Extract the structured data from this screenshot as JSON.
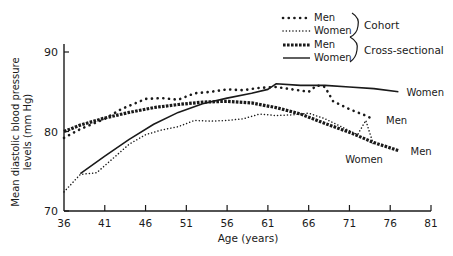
{
  "chart_data": {
    "type": "line",
    "title": "",
    "xlabel": "Age (years)",
    "ylabel": "Mean diastolic blood pressure levels (mm Hg)",
    "xlim": [
      36,
      81
    ],
    "ylim": [
      70,
      90
    ],
    "x_ticks": [
      "36",
      "41",
      "46",
      "51",
      "56",
      "61",
      "66",
      "71",
      "76",
      "81"
    ],
    "y_ticks": [
      "70",
      "80",
      "90"
    ],
    "grid": false,
    "legend": {
      "position": "top-right",
      "entries": [
        {
          "label": "Men",
          "style": "dotted-large",
          "group": "Cohort"
        },
        {
          "label": "Women",
          "style": "dotted-small",
          "group": "Cohort"
        },
        {
          "label": "Men",
          "style": "dashed-heavy",
          "group": "Cross-sectional"
        },
        {
          "label": "Women",
          "style": "solid",
          "group": "Cross-sectional"
        }
      ],
      "groups": [
        "Cohort",
        "Cross-sectional"
      ]
    },
    "series": [
      {
        "name": "Cohort Men",
        "style": "dotted-large",
        "x": [
          36,
          38,
          41,
          43,
          46,
          48,
          50,
          52,
          54,
          56,
          58,
          60,
          62,
          64,
          66,
          67,
          68,
          69,
          71,
          73,
          74
        ],
        "y": [
          79.2,
          80.3,
          81.6,
          82.8,
          84.1,
          84.2,
          84.0,
          84.8,
          85.0,
          85.3,
          85.2,
          85.5,
          85.6,
          85.3,
          85.0,
          85.8,
          85.6,
          83.8,
          82.8,
          82.0,
          81.5
        ]
      },
      {
        "name": "Cohort Women",
        "style": "dotted-small",
        "x": [
          36,
          38,
          40,
          42,
          44,
          46,
          48,
          50,
          52,
          54,
          56,
          58,
          60,
          62,
          64,
          66,
          68,
          70,
          72,
          73,
          74
        ],
        "y": [
          72.4,
          74.6,
          74.8,
          76.6,
          78.4,
          79.6,
          80.2,
          80.6,
          81.4,
          81.3,
          81.4,
          81.6,
          82.2,
          82.0,
          82.1,
          82.3,
          81.6,
          80.6,
          79.6,
          81.4,
          78.2
        ]
      },
      {
        "name": "Cross-sectional Men",
        "style": "dashed-heavy",
        "x": [
          36,
          38,
          41,
          44,
          47,
          50,
          53,
          56,
          59,
          62,
          65,
          68,
          71,
          74,
          77
        ],
        "y": [
          80.0,
          80.8,
          81.7,
          82.4,
          83.0,
          83.4,
          83.7,
          83.8,
          83.6,
          83.0,
          82.2,
          81.0,
          79.9,
          78.6,
          77.6
        ]
      },
      {
        "name": "Cross-sectional Women",
        "style": "solid",
        "x": [
          38,
          41,
          44,
          47,
          50,
          53,
          56,
          59,
          61,
          62,
          65,
          68,
          71,
          74,
          77
        ],
        "y": [
          74.7,
          76.9,
          79.0,
          80.9,
          82.4,
          83.5,
          84.2,
          84.8,
          85.3,
          86.0,
          85.8,
          85.8,
          85.6,
          85.4,
          85.0
        ]
      }
    ],
    "annotations": [
      {
        "text": "Women",
        "near_series": "Cross-sectional Women",
        "x": 77.5,
        "y": 85.0
      },
      {
        "text": "Men",
        "near_series": "Cohort Men",
        "x": 75,
        "y": 81.4
      },
      {
        "text": "Men",
        "near_series": "Cross-sectional Men",
        "x": 78,
        "y": 77.6
      },
      {
        "text": "Women",
        "near_series": "Cohort Women",
        "x": 70,
        "y": 76.5
      }
    ]
  }
}
